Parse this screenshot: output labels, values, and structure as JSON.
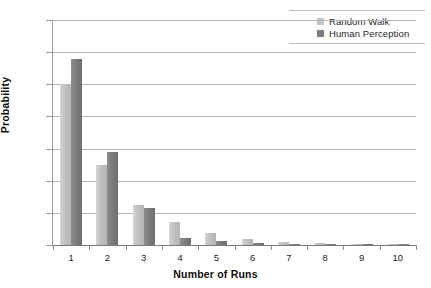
{
  "chart_data": {
    "type": "bar",
    "title": "",
    "xlabel": "Number of Runs",
    "ylabel": "Probability",
    "categories": [
      "1",
      "2",
      "3",
      "4",
      "5",
      "6",
      "7",
      "8",
      "9",
      "10"
    ],
    "series": [
      {
        "name": "Random Walk",
        "color": "#c4c4c4",
        "values": [
          0.5,
          0.25,
          0.125,
          0.072,
          0.037,
          0.018,
          0.009,
          0.006,
          0.004,
          0.004
        ]
      },
      {
        "name": "Human Perception",
        "color": "#7d7d7d",
        "values": [
          0.578,
          0.29,
          0.115,
          0.022,
          0.012,
          0.005,
          0.002,
          0.002,
          0.001,
          0.001
        ]
      }
    ],
    "ylim": [
      0,
      0.7
    ],
    "ytick_labels": [
      "0.7",
      "0.6",
      "0.5",
      "0.4",
      "0.3",
      "0.2",
      "0.1",
      "0"
    ],
    "ytick_values": [
      0.7,
      0.6,
      0.5,
      0.4,
      0.3,
      0.2,
      0.1,
      0
    ],
    "grid": true,
    "legend_position": "top-right"
  },
  "legend": {
    "items": [
      {
        "label": "Random Walk",
        "color": "#c4c4c4",
        "swatch_name": "legend-swatch-random-walk"
      },
      {
        "label": "Human Perception",
        "color": "#7d7d7d",
        "swatch_name": "legend-swatch-human-perception"
      }
    ]
  }
}
